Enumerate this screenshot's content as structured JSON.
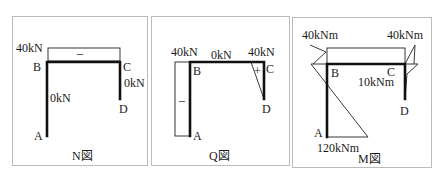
{
  "panels": [
    {
      "caption": "N図",
      "labels": {
        "top_left_value": "40kN",
        "sign_top": "–",
        "ab_value": "0kN",
        "cd_value": "0kN",
        "node_a": "A",
        "node_b": "B",
        "node_c": "C",
        "node_d": "D"
      }
    },
    {
      "caption": "Q図",
      "labels": {
        "ab_value": "40kN",
        "bc_value": "0kN",
        "cd_value": "40kN",
        "sign_ab": "–",
        "sign_cd": "+",
        "node_a": "A",
        "node_b": "B",
        "node_c": "C",
        "node_d": "D"
      }
    },
    {
      "caption": "M図",
      "labels": {
        "b_value": "40kNm",
        "c_value": "40kNm",
        "cd_value": "10kNm",
        "a_value": "120kNm",
        "node_a": "A",
        "node_b": "B",
        "node_c": "C",
        "node_d": "D"
      }
    }
  ]
}
